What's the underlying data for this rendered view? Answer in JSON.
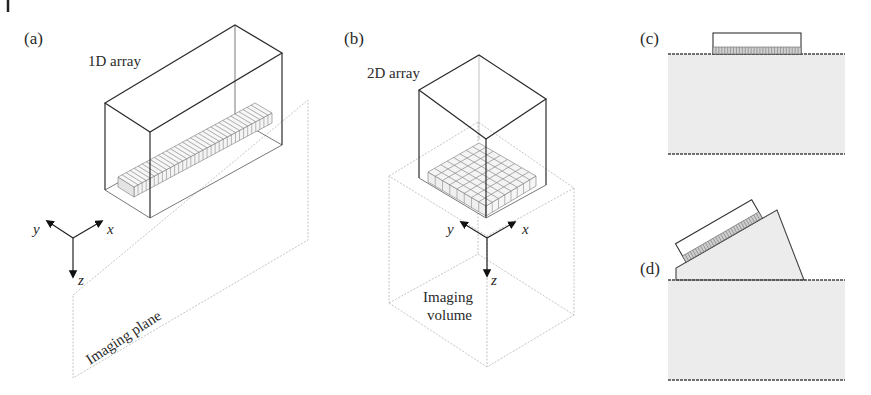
{
  "figure": {
    "top_mark": "I",
    "panels": {
      "a": {
        "label": "(a)",
        "probe_label": "1D array",
        "region_label": "Imaging plane",
        "axes": {
          "x": "x",
          "y": "y",
          "z": "z"
        },
        "element_count": 34
      },
      "b": {
        "label": "(b)",
        "probe_label": "2D array",
        "region_label_line1": "Imaging",
        "region_label_line2": "volume",
        "axes": {
          "x": "x",
          "y": "y",
          "z": "z"
        },
        "grid": "8x8"
      },
      "c": {
        "label": "(c)",
        "description": "Linear probe in direct contact with medium"
      },
      "d": {
        "label": "(d)",
        "description": "Probe mounted on angled wedge on medium"
      }
    },
    "colors": {
      "line": "#2b2b2b",
      "faint": "#bdbdbd",
      "medium_fill": "#ececec",
      "element_fill": "#f2f2f2",
      "text": "#2a2a2a"
    }
  }
}
